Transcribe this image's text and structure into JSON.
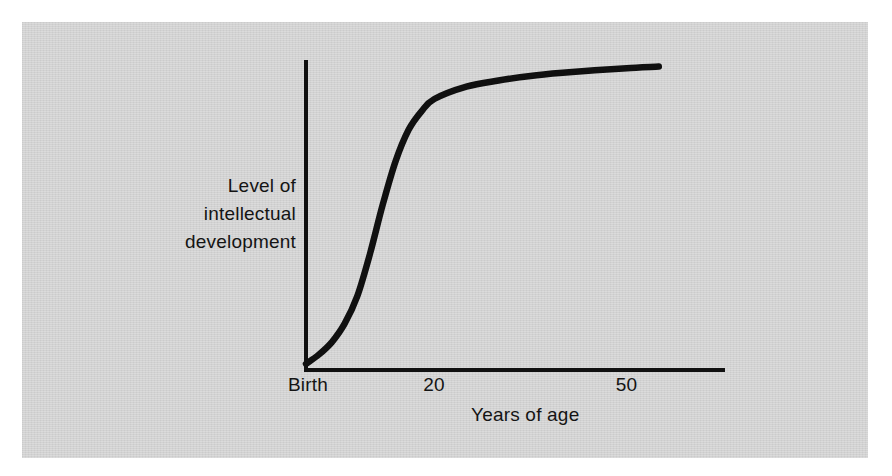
{
  "figure": {
    "background_color": "#d2d2d2",
    "ink_color": "#111111",
    "y_axis_label_lines": [
      "Level of",
      "intellectual",
      "development"
    ],
    "x_axis_title": "Years of age"
  },
  "chart_data": {
    "type": "line",
    "title": "",
    "xlabel": "Years of age",
    "ylabel": "Level of intellectual development",
    "grid": false,
    "legend": null,
    "xtick_labels": [
      "Birth",
      "20",
      "50"
    ],
    "xtick_values": [
      0,
      20,
      50
    ],
    "ytick_labels": [],
    "xlim": [
      0,
      65
    ],
    "ylim": [
      0,
      100
    ],
    "annotations": [],
    "series": [
      {
        "name": "Level of intellectual development",
        "description": "Negatively accelerated S-shaped growth curve: slow rise from birth, rapid acceleration through childhood, sharp deceleration after about age 20, near-plateau by age 50.",
        "x": [
          0,
          2,
          4,
          6,
          8,
          10,
          12,
          14,
          16,
          18,
          20,
          25,
          30,
          35,
          40,
          45,
          50,
          55
        ],
        "y": [
          2,
          5,
          9,
          15,
          24,
          38,
          54,
          68,
          78,
          84,
          88,
          92,
          94,
          95.5,
          96.5,
          97.3,
          98,
          98.5
        ]
      }
    ]
  }
}
